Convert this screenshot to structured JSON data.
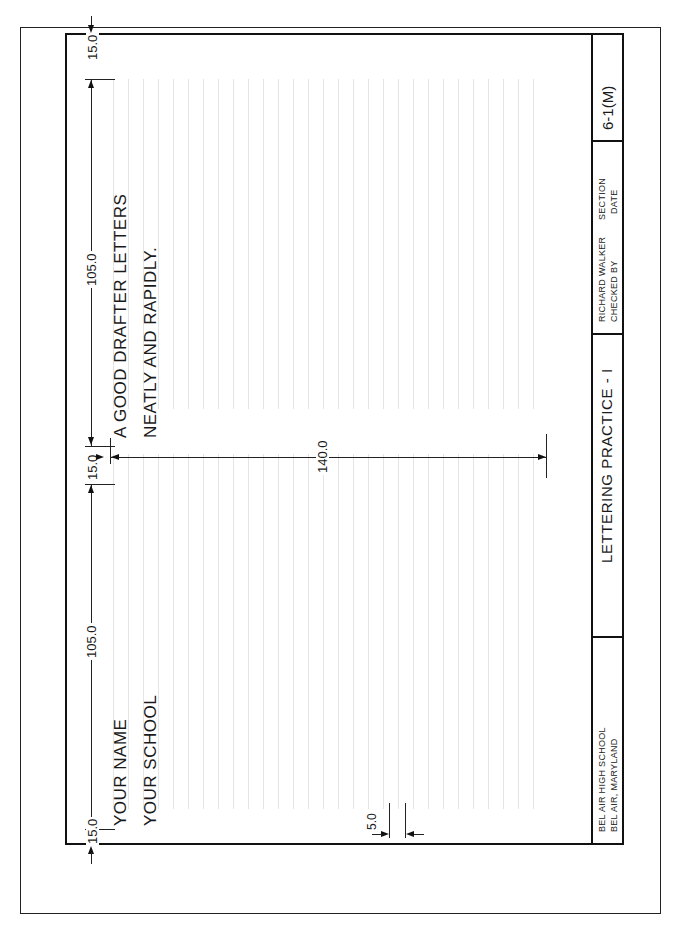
{
  "page_header": {
    "text": "(partially cut off header text)"
  },
  "sheet": {
    "title": "LETTERING PRACTICE - I",
    "sheet_number": "6-1(M)",
    "school": {
      "line1": "BEL AIR HIGH SCHOOL",
      "line2": "BEL AIR, MARYLAND"
    },
    "checker": {
      "name": "RICHARD WALKER",
      "label": "CHECKED BY"
    },
    "fields": {
      "section": "SECTION",
      "date": "DATE"
    }
  },
  "practice": {
    "left_block": {
      "line1": "YOUR NAME",
      "line2": "YOUR SCHOOL"
    },
    "right_block": {
      "line1": "A GOOD DRAFTER LETTERS",
      "line2": "NEATLY AND RAPIDLY."
    }
  },
  "dimensions": {
    "margin_top": "15.0",
    "margin_bottom": "15.0",
    "gap_middle": "15.0",
    "block_left_length": "105.0",
    "block_right_length": "105.0",
    "block_height": "140.0",
    "line_spacing": "5.0"
  },
  "colors": {
    "ink": "#111111",
    "guide": "#e4e4e4",
    "paper": "#ffffff"
  }
}
